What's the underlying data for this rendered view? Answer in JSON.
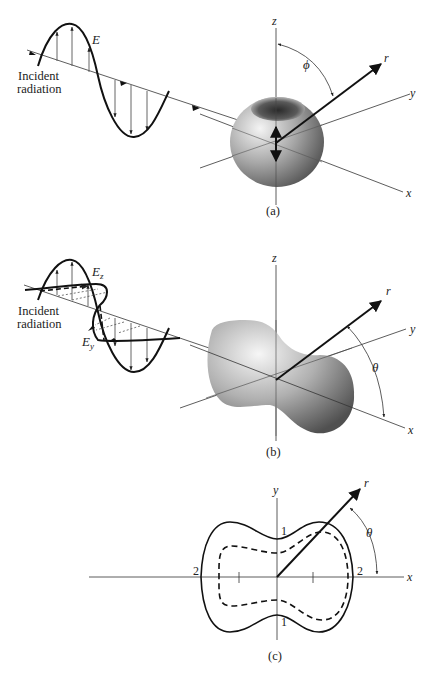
{
  "figure": {
    "panel_a": {
      "caption": "(a)",
      "incident_label_line1": "Incident",
      "incident_label_line2": "radiation",
      "field_label": "E",
      "axis_z": "z",
      "axis_y": "y",
      "axis_x": "x",
      "vector_label": "r",
      "angle_label": "ϕ",
      "shape": "torus-like dipole radiation pattern (linearly polarized incident wave)"
    },
    "panel_b": {
      "caption": "(b)",
      "incident_label_line1": "Incident",
      "incident_label_line2": "radiation",
      "field_label_z": "E",
      "field_label_z_sub": "z",
      "field_label_y": "E",
      "field_label_y_sub": "y",
      "axis_z": "z",
      "axis_y": "y",
      "axis_x": "x",
      "vector_label": "r",
      "angle_label": "θ",
      "shape": "peanut-shaped scattering pattern (unpolarized incident wave)"
    },
    "panel_c": {
      "caption": "(c)",
      "axis_y": "y",
      "axis_x": "x",
      "vector_label": "r",
      "angle_label": "θ",
      "tick_labels": {
        "x_left": "2",
        "x_right": "2",
        "y_top": "1",
        "y_bottom": "1"
      },
      "curves": [
        {
          "style": "solid",
          "description": "total scattered intensity 1 + cos²θ"
        },
        {
          "style": "dashed",
          "description": "inner reference contour"
        }
      ]
    }
  },
  "colors": {
    "ink": "#111111",
    "axis": "#333333",
    "surface_light": "#e6e6e6",
    "surface_dark": "#4a4a4a",
    "background": "#ffffff"
  }
}
